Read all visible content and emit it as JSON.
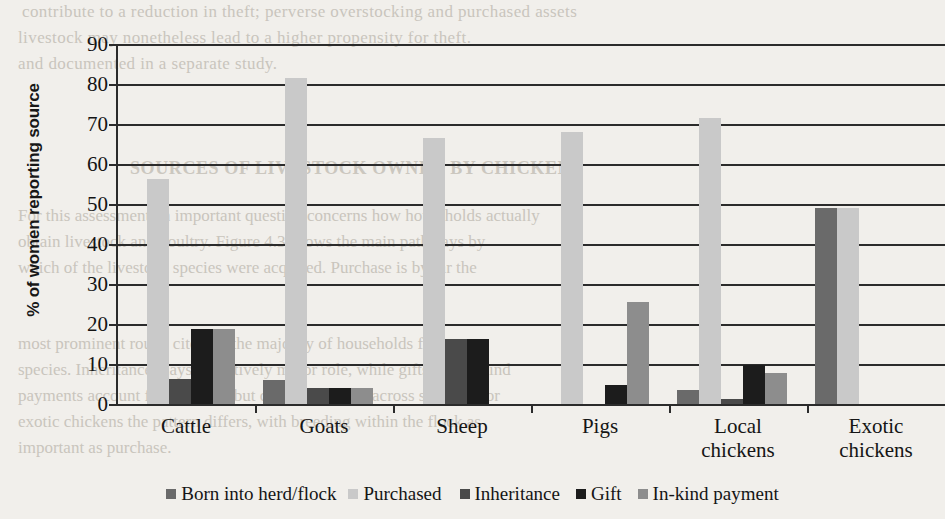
{
  "page": {
    "background_color": "#f1efeb",
    "bleed_text": [
      "contribute to a reduction in theft; perverse overstocking and purchased assets",
      "livestock may nonetheless lead to a higher propensity for theft.",
      "and documented in a separate study."
    ],
    "bleed_heading": "SOURCES OF LIVESTOCK OWNED BY CHICKENS",
    "bleed_body": [
      "For this assessment an important question concerns how households actually",
      "obtain livestock and poultry. Figure 4.3 shows the main pathways by",
      "which of the livestock species were acquired. Purchase is by far the",
      "",
      "most prominent route, cited by the majority of households for every",
      "species. Inheritance plays a relatively minor role, while gifts and in-kind",
      "payments account for a modest but consistent share across species. For",
      "exotic chickens the pattern differs, with breeding within the flock as",
      "important as purchase."
    ]
  },
  "chart_data": {
    "type": "bar",
    "title": "",
    "subtitle": "",
    "xlabel": "",
    "ylabel": "% of women reporting source",
    "ylim": [
      0,
      90
    ],
    "ytick_step": 10,
    "yticks": [
      "90",
      "80",
      "70",
      "60",
      "50",
      "40",
      "30",
      "20",
      "10",
      "0"
    ],
    "grid": true,
    "grid_axis": "y",
    "legend_position": "bottom",
    "categories": [
      "Cattle",
      "Goats",
      "Sheep",
      "Pigs",
      "Local chickens",
      "Exotic chickens"
    ],
    "category_lines": [
      [
        "Cattle"
      ],
      [
        "Goats"
      ],
      [
        "Sheep"
      ],
      [
        "Pigs"
      ],
      [
        "Local",
        "chickens"
      ],
      [
        "Exotic",
        "chickens"
      ]
    ],
    "series": [
      {
        "name": "Born into herd/flock",
        "color": "#6a6a6a",
        "values": [
          0,
          6.0,
          0,
          0,
          3.5,
          49.0
        ]
      },
      {
        "name": "Purchased",
        "color": "#c9c9c9",
        "values": [
          56.2,
          81.5,
          66.4,
          68.0,
          71.5,
          49.0
        ]
      },
      {
        "name": "Inheritance",
        "color": "#4a4a4a",
        "values": [
          6.2,
          4.0,
          16.2,
          0,
          1.3,
          0
        ]
      },
      {
        "name": "Gift",
        "color": "#1c1c1c",
        "values": [
          18.8,
          4.0,
          16.2,
          4.7,
          9.8,
          0
        ]
      },
      {
        "name": "In-kind payment",
        "color": "#8d8d8d",
        "values": [
          18.8,
          4.0,
          0,
          25.6,
          7.8,
          0
        ]
      }
    ]
  }
}
